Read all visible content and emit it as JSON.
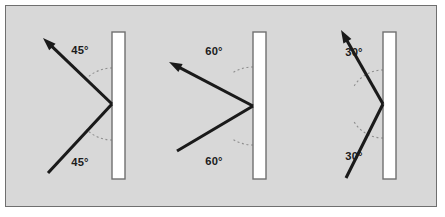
{
  "figure": {
    "panel": {
      "background_color": "#d8d8d8",
      "border_color": "#6f6f6f",
      "page_background_color": "#ffffff"
    },
    "style": {
      "ray_color": "#1a1a1a",
      "mirror_fill_color": "#ffffff",
      "mirror_stroke_color": "#707070",
      "arc_color": "#8e8e8e",
      "label_color": "#1c1c1c"
    }
  },
  "diagrams": [
    {
      "id": "diagram-45",
      "angle_value": 45,
      "angle_unit": "degrees",
      "incident_label": "45°",
      "reflected_label": "45°",
      "mirror": {
        "x": 111,
        "y": 31,
        "width": 13,
        "height": 147
      },
      "vertex": {
        "x": 111,
        "y": 103
      },
      "reflected_ray": {
        "from_x": 111,
        "from_y": 103,
        "to_x": 42,
        "to_y": 37
      },
      "incident_ray": {
        "from_x": 47,
        "from_y": 172,
        "to_x": 111,
        "to_y": 103
      },
      "upper_arc": {
        "cx": 111,
        "cy": 103,
        "r": 36
      },
      "lower_arc": {
        "cx": 111,
        "cy": 103,
        "r": 36
      },
      "upper_label_pos": {
        "x": 79,
        "y": 53
      },
      "lower_label_pos": {
        "x": 79,
        "y": 165
      }
    },
    {
      "id": "diagram-60",
      "angle_value": 60,
      "angle_unit": "degrees",
      "incident_label": "60°",
      "reflected_label": "60°",
      "mirror": {
        "x": 252,
        "y": 31,
        "width": 13,
        "height": 147
      },
      "vertex": {
        "x": 252,
        "y": 105
      },
      "reflected_ray": {
        "from_x": 252,
        "from_y": 105,
        "to_x": 168,
        "to_y": 61
      },
      "incident_ray": {
        "from_x": 176,
        "from_y": 150,
        "to_x": 252,
        "to_y": 105
      },
      "upper_arc": {
        "cx": 252,
        "cy": 105,
        "r": 39
      },
      "lower_arc": {
        "cx": 252,
        "cy": 105,
        "r": 39
      },
      "upper_label_pos": {
        "x": 213,
        "y": 54
      },
      "lower_label_pos": {
        "x": 213,
        "y": 164
      }
    },
    {
      "id": "diagram-30",
      "angle_value": 30,
      "angle_unit": "degrees",
      "incident_label": "30°",
      "reflected_label": "30°",
      "mirror": {
        "x": 382,
        "y": 31,
        "width": 13,
        "height": 147
      },
      "vertex": {
        "x": 382,
        "y": 103
      },
      "reflected_ray": {
        "from_x": 382,
        "from_y": 103,
        "to_x": 340,
        "to_y": 29
      },
      "incident_ray": {
        "from_x": 345,
        "from_y": 177,
        "to_x": 382,
        "to_y": 103
      },
      "upper_arc": {
        "cx": 382,
        "cy": 103,
        "r": 34
      },
      "lower_arc": {
        "cx": 382,
        "cy": 103,
        "r": 34
      },
      "upper_label_pos": {
        "x": 353,
        "y": 55
      },
      "lower_label_pos": {
        "x": 353,
        "y": 159
      }
    }
  ]
}
